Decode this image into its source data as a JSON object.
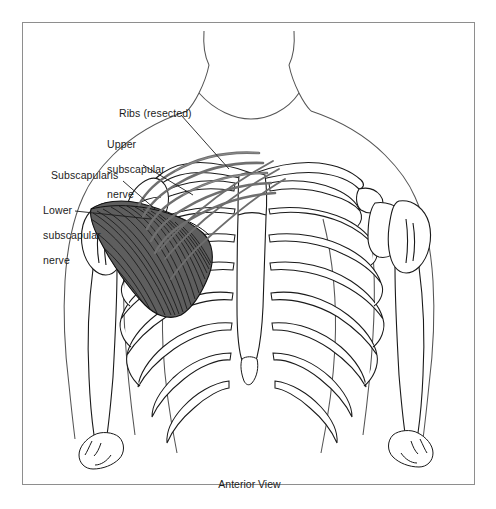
{
  "figure": {
    "caption": "Anterior View",
    "view": "Anterior",
    "border_color": "#8e8e8e",
    "background_color": "#ffffff"
  },
  "labels": [
    {
      "id": "ribs-resected",
      "text": "Ribs (resected)",
      "lines": [
        "Ribs (resected)"
      ],
      "x": 118,
      "y": 106
    },
    {
      "id": "upper-subscapular",
      "text": "Upper subscapular nerve",
      "lines": [
        "Upper",
        "subscapular",
        "nerve"
      ],
      "x": 88,
      "y": 124
    },
    {
      "id": "subscapularis",
      "text": "Subscapularis",
      "lines": [
        "Subscapularis"
      ],
      "x": 50,
      "y": 168
    },
    {
      "id": "lower-subscapular",
      "text": "Lower subscapular nerve",
      "lines": [
        "Lower",
        "subscapular",
        "nerve"
      ],
      "x": 22,
      "y": 190
    }
  ],
  "anatomy": {
    "structures": [
      "body-outline",
      "neck",
      "head-base",
      "clavicle-left",
      "clavicle-right",
      "sternum",
      "ribs",
      "costal-cartilage",
      "scapula-left",
      "humerus-left",
      "humerus-right",
      "glenohumeral-joint",
      "subscapularis-muscle",
      "resected-rib-stumps",
      "upper-subscapular-nerve",
      "lower-subscapular-nerve"
    ],
    "muscle_fill": "#5e5e5e",
    "muscle_stroke": "#111111",
    "bone_stroke": "#1a1a1a",
    "outline_stroke": "#4a4a4a",
    "nerve_stroke": "#6d6d6d"
  }
}
